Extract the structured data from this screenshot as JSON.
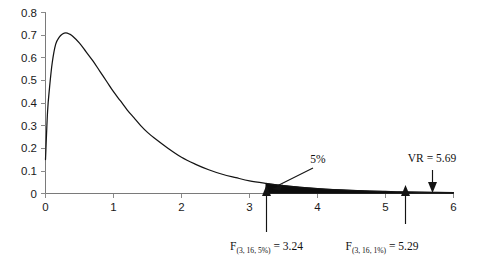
{
  "chart_data": {
    "type": "line",
    "title": "",
    "subtitle": "",
    "xlabel": "",
    "ylabel": "",
    "xlim": [
      0,
      6
    ],
    "ylim": [
      0,
      0.8
    ],
    "grid": false,
    "legend_position": "none",
    "x_ticks": [
      "0",
      "1",
      "2",
      "3",
      "4",
      "5",
      "6"
    ],
    "x_tick_values": [
      0,
      1,
      2,
      3,
      4,
      5,
      6
    ],
    "y_ticks": [
      "0",
      "0.1",
      "0.2",
      "0.3",
      "0.4",
      "0.5",
      "0.6",
      "0.7",
      "0.8"
    ],
    "y_tick_values": [
      0,
      0.1,
      0.2,
      0.3,
      0.4,
      0.5,
      0.6,
      0.7,
      0.8
    ],
    "series": [
      {
        "name": "F distribution density (df1 = 3, df2 = 16)",
        "x": [
          0.0,
          0.03,
          0.06,
          0.1,
          0.15,
          0.2,
          0.25,
          0.3,
          0.35,
          0.4,
          0.5,
          0.6,
          0.7,
          0.8,
          0.9,
          1.0,
          1.1,
          1.2,
          1.3,
          1.4,
          1.5,
          1.6,
          1.8,
          2.0,
          2.2,
          2.4,
          2.6,
          2.8,
          3.0,
          3.24,
          3.5,
          4.0,
          4.5,
          5.0,
          5.29,
          5.69,
          6.0
        ],
        "y": [
          0.15,
          0.36,
          0.47,
          0.58,
          0.66,
          0.69,
          0.705,
          0.71,
          0.705,
          0.695,
          0.665,
          0.625,
          0.585,
          0.54,
          0.495,
          0.45,
          0.41,
          0.37,
          0.335,
          0.3,
          0.27,
          0.245,
          0.2,
          0.16,
          0.13,
          0.105,
          0.085,
          0.07,
          0.056,
          0.045,
          0.035,
          0.022,
          0.014,
          0.009,
          0.007,
          0.005,
          0.004
        ]
      }
    ],
    "shaded_region": {
      "label": "5%",
      "from_x": 3.24,
      "to_x": 6.0,
      "description": "upper tail area beyond the 5% critical value"
    },
    "annotations": [
      {
        "name": "tail-percent",
        "text": "5%",
        "x": 3.62,
        "y": 0.205,
        "points_to_x": 3.3,
        "points_to_y": 0.035
      },
      {
        "name": "critical-5pct",
        "label_main": "F",
        "label_sub": "(3, 16, 5%)",
        "label_tail": " = 3.24",
        "value": 3.24,
        "arrow_direction": "up"
      },
      {
        "name": "critical-1pct",
        "label_main": "F",
        "label_sub": "(3, 16, 1%)",
        "label_tail": " = 5.29",
        "value": 5.29,
        "arrow_direction": "up"
      },
      {
        "name": "variance-ratio",
        "label_main": "VR",
        "label_tail": " = 5.69",
        "value": 5.69,
        "arrow_direction": "down"
      }
    ],
    "colors": {
      "curve": "#141414",
      "tail_fill": "#0d0d0d",
      "axis": "#7a7a7a",
      "text": "#111111",
      "background": "#ffffff"
    }
  }
}
